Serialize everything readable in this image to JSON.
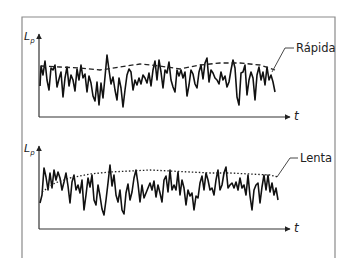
{
  "diagram": {
    "frame": {
      "left": 22,
      "top": 17,
      "right": 335,
      "bottom": 258,
      "color": "#8a8a8a"
    },
    "panels": [
      {
        "id": "fast",
        "y_axis_label": "L",
        "y_axis_sub": "p",
        "x_axis_label": "t",
        "curve_label": "Rápida",
        "curve_style": "dashed",
        "origin": {
          "x": 39,
          "y": 117
        },
        "axis_top": 34,
        "axis_right": 290,
        "label_pos": {
          "x": 296,
          "y": 42
        },
        "leader": [
          [
            294,
            48
          ],
          [
            285,
            48
          ],
          [
            272,
            72
          ]
        ],
        "envelope": [
          [
            41,
            66
          ],
          [
            60,
            67
          ],
          [
            80,
            68
          ],
          [
            100,
            70
          ],
          [
            120,
            67
          ],
          [
            140,
            64
          ],
          [
            160,
            66
          ],
          [
            180,
            69
          ],
          [
            200,
            65
          ],
          [
            220,
            63
          ],
          [
            240,
            63
          ],
          [
            260,
            65
          ],
          [
            275,
            70
          ]
        ],
        "signal": [
          [
            40,
            86
          ],
          [
            41,
            66
          ],
          [
            43,
            75
          ],
          [
            45,
            61
          ],
          [
            47,
            80
          ],
          [
            49,
            90
          ],
          [
            51,
            68
          ],
          [
            53,
            70
          ],
          [
            55,
            65
          ],
          [
            57,
            87
          ],
          [
            59,
            79
          ],
          [
            61,
            72
          ],
          [
            63,
            97
          ],
          [
            65,
            78
          ],
          [
            67,
            67
          ],
          [
            69,
            86
          ],
          [
            71,
            75
          ],
          [
            73,
            80
          ],
          [
            75,
            91
          ],
          [
            77,
            69
          ],
          [
            79,
            80
          ],
          [
            81,
            65
          ],
          [
            83,
            78
          ],
          [
            85,
            74
          ],
          [
            87,
            92
          ],
          [
            89,
            76
          ],
          [
            91,
            83
          ],
          [
            93,
            96
          ],
          [
            95,
            101
          ],
          [
            97,
            82
          ],
          [
            99,
            105
          ],
          [
            101,
            83
          ],
          [
            103,
            98
          ],
          [
            105,
            77
          ],
          [
            107,
            55
          ],
          [
            109,
            70
          ],
          [
            111,
            84
          ],
          [
            113,
            77
          ],
          [
            115,
            90
          ],
          [
            117,
            100
          ],
          [
            119,
            78
          ],
          [
            121,
            88
          ],
          [
            123,
            107
          ],
          [
            125,
            90
          ],
          [
            127,
            75
          ],
          [
            129,
            69
          ],
          [
            131,
            72
          ],
          [
            133,
            90
          ],
          [
            135,
            80
          ],
          [
            137,
            85
          ],
          [
            139,
            78
          ],
          [
            141,
            84
          ],
          [
            143,
            75
          ],
          [
            145,
            78
          ],
          [
            147,
            83
          ],
          [
            149,
            73
          ],
          [
            151,
            86
          ],
          [
            153,
            70
          ],
          [
            155,
            61
          ],
          [
            157,
            80
          ],
          [
            159,
            60
          ],
          [
            161,
            72
          ],
          [
            163,
            88
          ],
          [
            165,
            70
          ],
          [
            167,
            73
          ],
          [
            169,
            62
          ],
          [
            171,
            80
          ],
          [
            173,
            87
          ],
          [
            175,
            92
          ],
          [
            177,
            70
          ],
          [
            179,
            76
          ],
          [
            181,
            70
          ],
          [
            183,
            78
          ],
          [
            185,
            72
          ],
          [
            187,
            96
          ],
          [
            189,
            85
          ],
          [
            191,
            70
          ],
          [
            193,
            74
          ],
          [
            195,
            84
          ],
          [
            197,
            88
          ],
          [
            199,
            72
          ],
          [
            201,
            65
          ],
          [
            203,
            79
          ],
          [
            205,
            63
          ],
          [
            207,
            58
          ],
          [
            209,
            82
          ],
          [
            211,
            70
          ],
          [
            213,
            73
          ],
          [
            215,
            78
          ],
          [
            217,
            80
          ],
          [
            219,
            84
          ],
          [
            221,
            72
          ],
          [
            223,
            80
          ],
          [
            225,
            76
          ],
          [
            227,
            87
          ],
          [
            229,
            82
          ],
          [
            231,
            70
          ],
          [
            233,
            60
          ],
          [
            235,
            68
          ],
          [
            237,
            97
          ],
          [
            239,
            105
          ],
          [
            241,
            73
          ],
          [
            243,
            72
          ],
          [
            245,
            65
          ],
          [
            247,
            95
          ],
          [
            249,
            80
          ],
          [
            251,
            72
          ],
          [
            253,
            78
          ],
          [
            255,
            100
          ],
          [
            257,
            75
          ],
          [
            259,
            67
          ],
          [
            261,
            80
          ],
          [
            263,
            72
          ],
          [
            265,
            85
          ],
          [
            267,
            67
          ],
          [
            269,
            80
          ],
          [
            271,
            75
          ],
          [
            273,
            82
          ],
          [
            275,
            92
          ]
        ]
      },
      {
        "id": "slow",
        "y_axis_label": "L",
        "y_axis_sub": "p",
        "x_axis_label": "t",
        "curve_label": "Lenta",
        "curve_style": "dotted",
        "origin": {
          "x": 39,
          "y": 229
        },
        "axis_top": 146,
        "axis_right": 290,
        "label_pos": {
          "x": 300,
          "y": 152
        },
        "leader": [
          [
            298,
            158
          ],
          [
            290,
            158
          ],
          [
            277,
            177
          ]
        ],
        "envelope": [
          [
            42,
            192
          ],
          [
            55,
            183
          ],
          [
            70,
            178
          ],
          [
            90,
            174
          ],
          [
            110,
            172
          ],
          [
            130,
            171
          ],
          [
            150,
            170
          ],
          [
            170,
            171
          ],
          [
            190,
            172
          ],
          [
            210,
            173
          ],
          [
            230,
            173
          ],
          [
            250,
            174
          ],
          [
            270,
            175
          ],
          [
            278,
            177
          ]
        ],
        "signal": [
          [
            40,
            203
          ],
          [
            42,
            195
          ],
          [
            44,
            168
          ],
          [
            46,
            177
          ],
          [
            48,
            190
          ],
          [
            50,
            173
          ],
          [
            52,
            188
          ],
          [
            54,
            170
          ],
          [
            56,
            180
          ],
          [
            58,
            172
          ],
          [
            60,
            178
          ],
          [
            62,
            190
          ],
          [
            64,
            182
          ],
          [
            66,
            173
          ],
          [
            68,
            186
          ],
          [
            70,
            203
          ],
          [
            72,
            182
          ],
          [
            74,
            175
          ],
          [
            76,
            190
          ],
          [
            78,
            185
          ],
          [
            80,
            193
          ],
          [
            82,
            180
          ],
          [
            84,
            210
          ],
          [
            86,
            195
          ],
          [
            88,
            178
          ],
          [
            90,
            187
          ],
          [
            92,
            175
          ],
          [
            94,
            200
          ],
          [
            96,
            205
          ],
          [
            98,
            185
          ],
          [
            100,
            196
          ],
          [
            102,
            209
          ],
          [
            104,
            215
          ],
          [
            106,
            200
          ],
          [
            108,
            183
          ],
          [
            110,
            165
          ],
          [
            112,
            186
          ],
          [
            114,
            175
          ],
          [
            116,
            195
          ],
          [
            118,
            202
          ],
          [
            120,
            190
          ],
          [
            122,
            210
          ],
          [
            124,
            214
          ],
          [
            126,
            193
          ],
          [
            128,
            184
          ],
          [
            130,
            200
          ],
          [
            132,
            192
          ],
          [
            134,
            178
          ],
          [
            136,
            170
          ],
          [
            138,
            184
          ],
          [
            140,
            202
          ],
          [
            142,
            185
          ],
          [
            144,
            198
          ],
          [
            146,
            193
          ],
          [
            148,
            188
          ],
          [
            150,
            183
          ],
          [
            152,
            190
          ],
          [
            154,
            181
          ],
          [
            156,
            197
          ],
          [
            158,
            185
          ],
          [
            160,
            193
          ],
          [
            162,
            202
          ],
          [
            164,
            180
          ],
          [
            166,
            176
          ],
          [
            168,
            192
          ],
          [
            170,
            170
          ],
          [
            172,
            190
          ],
          [
            174,
            185
          ],
          [
            176,
            190
          ],
          [
            178,
            172
          ],
          [
            180,
            195
          ],
          [
            182,
            180
          ],
          [
            184,
            188
          ],
          [
            186,
            205
          ],
          [
            188,
            190
          ],
          [
            190,
            196
          ],
          [
            192,
            193
          ],
          [
            194,
            210
          ],
          [
            196,
            196
          ],
          [
            198,
            198
          ],
          [
            200,
            183
          ],
          [
            202,
            176
          ],
          [
            204,
            190
          ],
          [
            206,
            173
          ],
          [
            208,
            180
          ],
          [
            210,
            190
          ],
          [
            212,
            188
          ],
          [
            214,
            195
          ],
          [
            216,
            180
          ],
          [
            218,
            170
          ],
          [
            220,
            190
          ],
          [
            222,
            185
          ],
          [
            224,
            173
          ],
          [
            226,
            167
          ],
          [
            228,
            188
          ],
          [
            230,
            185
          ],
          [
            232,
            183
          ],
          [
            234,
            188
          ],
          [
            236,
            182
          ],
          [
            238,
            190
          ],
          [
            240,
            178
          ],
          [
            242,
            188
          ],
          [
            244,
            185
          ],
          [
            246,
            195
          ],
          [
            248,
            175
          ],
          [
            250,
            196
          ],
          [
            252,
            210
          ],
          [
            254,
            190
          ],
          [
            256,
            185
          ],
          [
            258,
            183
          ],
          [
            260,
            203
          ],
          [
            262,
            187
          ],
          [
            264,
            175
          ],
          [
            266,
            190
          ],
          [
            268,
            175
          ],
          [
            270,
            192
          ],
          [
            272,
            183
          ],
          [
            274,
            195
          ],
          [
            276,
            188
          ],
          [
            278,
            200
          ]
        ]
      }
    ]
  }
}
